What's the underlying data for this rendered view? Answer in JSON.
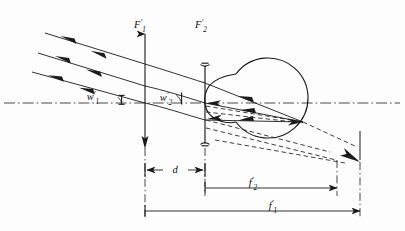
{
  "figure": {
    "background_color": "#fdfdfd",
    "ink_color": "#1a1a1a"
  },
  "labels": {
    "front_focal_spectacle": {
      "base": "F",
      "prime": "′",
      "sub": "1",
      "text": "F′1"
    },
    "front_focal_eye": {
      "base": "F",
      "prime": "′",
      "sub": "2",
      "text": "F′2"
    },
    "angle_object": {
      "base": "w",
      "prime": "′",
      "sub": "1",
      "text": "w′1"
    },
    "angle_image": {
      "base": "w",
      "prime": "′",
      "sub": "2",
      "text": "w′2"
    },
    "separation": {
      "base": "d",
      "prime": "",
      "sub": "",
      "text": "d"
    },
    "focal_eye": {
      "base": "f",
      "prime": "′",
      "sub": "2",
      "text": "f′2"
    },
    "focal_spectacle": {
      "base": "f",
      "prime": "′",
      "sub": "1",
      "text": "f′1"
    }
  },
  "dimensions": {
    "d": {
      "label": "d",
      "x_start": 145,
      "x_end": 205,
      "y": 170,
      "arrow_style": "inward"
    },
    "f2prime": {
      "label": "f′2",
      "x_start": 205,
      "x_end": 337,
      "y": 188,
      "arrow_style": "right"
    },
    "f1prime": {
      "label": "f′1",
      "x_start": 145,
      "x_end": 360,
      "y": 211,
      "arrow_style": "right"
    }
  },
  "optical_elements": {
    "optical_axis": {
      "name": "optical-axis",
      "y": 103,
      "x_start": 4,
      "x_end": 400,
      "style": "dash-dot"
    },
    "spectacle_lens_plane": {
      "name": "spectacle-lens-plane",
      "x": 145,
      "y_top": 30,
      "y_bottom": 168
    },
    "eye_lens": {
      "name": "eye-lens",
      "x": 205,
      "y_top": 63,
      "y_bottom": 146
    },
    "eyeball": {
      "name": "eyeball",
      "cx": 268,
      "cy": 98,
      "r": 40
    },
    "focus_point": {
      "name": "retinal-focus-point",
      "x": 303,
      "y": 122
    },
    "vertical_ref_f2": {
      "name": "vertical-reference-f2prime",
      "x": 337
    },
    "vertical_ref_f1": {
      "name": "vertical-reference-f1prime",
      "x": 360
    }
  },
  "rays": {
    "incoming_count": 3,
    "incoming_arrowheads_per_ray": 2,
    "incoming_style": "solid",
    "outgoing_style": "solid",
    "virtual_style": "dashed",
    "description": "Three parallel oblique rays enter from upper left, refract at the spectacle lens plane and again at the eye lens, converge on the retina; dashed extensions continue beyond the eye to the f′1 reference line."
  }
}
